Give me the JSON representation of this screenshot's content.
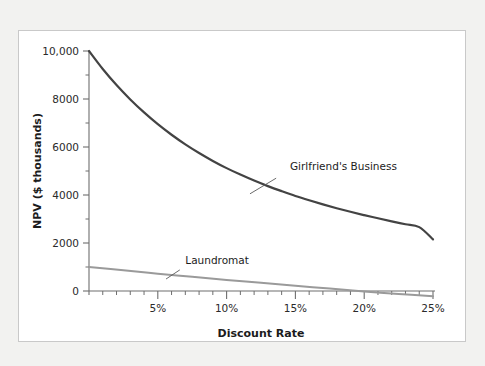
{
  "figure": {
    "background_color": "#f2f2f0",
    "panel_color": "#ffffff",
    "panel_border_color": "#c9c9c9"
  },
  "chart_data": {
    "type": "line",
    "title": "",
    "xlabel": "Discount Rate",
    "ylabel": "NPV ($ thousands)",
    "xlim": [
      0,
      25
    ],
    "ylim": [
      -300,
      10000
    ],
    "grid": false,
    "legend_position": "inline-annotation",
    "xticks": [
      0,
      5,
      10,
      15,
      20,
      25
    ],
    "xtick_labels": [
      "",
      "5%",
      "10%",
      "15%",
      "20%",
      "25%"
    ],
    "xminor_tick_step": 1,
    "yticks": [
      0,
      2000,
      4000,
      6000,
      8000,
      10000
    ],
    "ytick_labels": [
      "0",
      "2000",
      "4000",
      "6000",
      "8000",
      "10,000"
    ],
    "yminor_tick_step": 1000,
    "series": [
      {
        "name": "Girlfriend's Business",
        "color": "#434343",
        "width": 2.2,
        "label_x": 14.6,
        "label_y": 5050,
        "leader_from_x": 13.6,
        "leader_from_y": 4700,
        "leader_to_x": 11.7,
        "leader_to_y": 4050,
        "x": [
          0,
          1,
          2,
          3,
          4,
          5,
          6,
          7,
          8,
          9,
          10,
          11,
          12,
          13,
          14,
          15,
          16,
          17,
          18,
          19,
          20,
          21,
          22,
          23,
          24,
          25
        ],
        "values": [
          10000,
          9250,
          8580,
          7980,
          7440,
          6950,
          6510,
          6110,
          5750,
          5420,
          5120,
          4850,
          4600,
          4370,
          4160,
          3960,
          3780,
          3610,
          3450,
          3300,
          3160,
          3030,
          2900,
          2780,
          2660,
          2150
        ]
      },
      {
        "name": "Laundromat",
        "color": "#9a9a9a",
        "width": 2.0,
        "label_x": 7.0,
        "label_y": 1120,
        "leader_from_x": 6.6,
        "leader_from_y": 880,
        "leader_to_x": 5.6,
        "leader_to_y": 500,
        "x": [
          0,
          2.5,
          5,
          7.5,
          10,
          12.5,
          15,
          17.5,
          20,
          22.5,
          25
        ],
        "values": [
          1000,
          860,
          720,
          590,
          460,
          340,
          220,
          100,
          -20,
          -120,
          -220
        ]
      }
    ]
  },
  "axis_colors": {
    "axis_line": "#6e6e6e",
    "tick": "#6e6e6e",
    "text": "#1c1c1c"
  }
}
